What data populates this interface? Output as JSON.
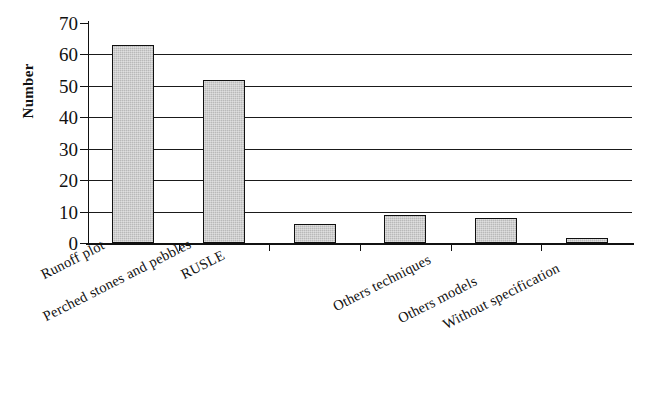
{
  "chart_data": {
    "type": "bar",
    "title": "",
    "xlabel": "",
    "ylabel": "Number",
    "ylim": [
      0,
      70
    ],
    "ytick_values": [
      0,
      10,
      20,
      30,
      40,
      50,
      60,
      70
    ],
    "ytick_labels": [
      "0",
      "10",
      "20",
      "30",
      "40",
      "50",
      "60",
      "70"
    ],
    "grid": true,
    "grid_axis": "y",
    "legend": false,
    "categories": [
      "Runoff plot",
      "RUSLE",
      "Perched stones and pebbles",
      "Others techniques",
      "Others models",
      "Without specification"
    ],
    "values": [
      63,
      52,
      6,
      9,
      8,
      1.5
    ],
    "bar_fill_color": "#b9b9b9",
    "bar_edge_color": "#101010"
  }
}
